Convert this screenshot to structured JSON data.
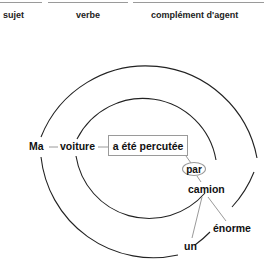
{
  "header": {
    "columns": [
      {
        "label": "sujet"
      },
      {
        "label": "verbe"
      },
      {
        "label": "complément d'agent"
      }
    ]
  },
  "diagram": {
    "words": {
      "ma": "Ma",
      "voiture": "voiture",
      "verb": "a été percutée",
      "par": "par",
      "camion": "camion",
      "enorme": "énorme",
      "un": "un"
    },
    "circles": [
      {
        "name": "outer",
        "cx": 147,
        "cy": 147,
        "r": 113
      },
      {
        "name": "inner",
        "cx": 147,
        "cy": 148,
        "r": 74
      }
    ],
    "colors": {
      "circle": "#222222",
      "connector": "#9a9a9a"
    }
  }
}
